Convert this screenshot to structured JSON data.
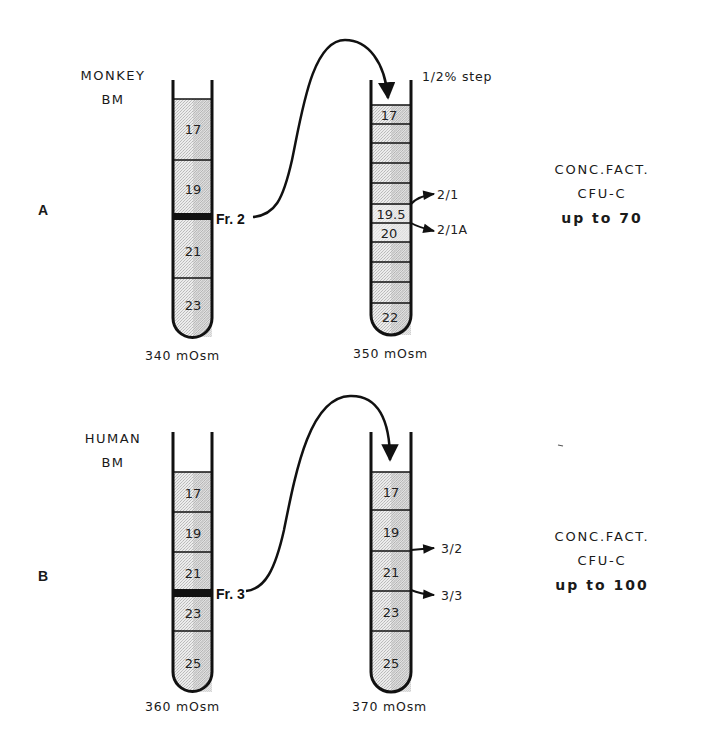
{
  "figure": {
    "colors": {
      "ink": "#111111",
      "fill": "#d9d9d9",
      "fill_light": "#ececec",
      "background": "#ffffff"
    },
    "panels": [
      {
        "id": "A",
        "letter": "A",
        "species_line1": "MONKEY",
        "species_line2": "BM",
        "first_tube": {
          "bands": [
            "17",
            "19",
            "21",
            "23"
          ],
          "osmolality": "340 mOsm",
          "fraction_label": "Fr. 2"
        },
        "second_tube": {
          "step_label": "1/2% step",
          "bands": [
            "17",
            "",
            "",
            "",
            "",
            "19.5",
            "20",
            "",
            "",
            "",
            "22"
          ],
          "osmolality": "350 mOsm",
          "outputs": [
            "2/1",
            "2/1A"
          ]
        },
        "result": {
          "line1": "CONC.FACT.",
          "line2": "CFU-C",
          "line3": "up to 70"
        }
      },
      {
        "id": "B",
        "letter": "B",
        "species_line1": "HUMAN",
        "species_line2": "BM",
        "first_tube": {
          "bands": [
            "17",
            "19",
            "21",
            "23",
            "25"
          ],
          "osmolality": "360 mOsm",
          "fraction_label": "Fr. 3"
        },
        "second_tube": {
          "bands": [
            "17",
            "19",
            "21",
            "23",
            "25"
          ],
          "osmolality": "370 mOsm",
          "outputs": [
            "3/2",
            "3/3"
          ]
        },
        "result": {
          "line1": "CONC.FACT.",
          "line2": "CFU-C",
          "line3": "up to 100"
        }
      }
    ]
  }
}
